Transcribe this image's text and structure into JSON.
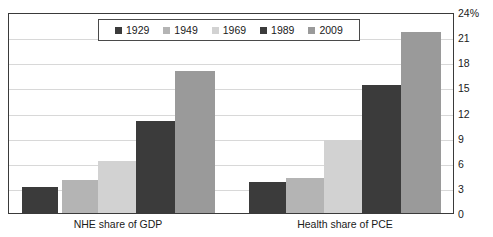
{
  "chart_data": {
    "type": "bar",
    "title": "",
    "subtitle": "",
    "xlabel": "",
    "ylabel": "",
    "categories": [
      "NHE share of GDP",
      "Health share of PCE"
    ],
    "series": [
      {
        "name": "1929",
        "color": "#3b3b3b",
        "values": [
          3.1,
          3.7
        ]
      },
      {
        "name": "1949",
        "color": "#b4b4b4",
        "values": [
          4.0,
          4.3
        ]
      },
      {
        "name": "1969",
        "color": "#d2d2d2",
        "values": [
          6.3,
          8.9
        ]
      },
      {
        "name": "1989",
        "color": "#3b3b3b",
        "values": [
          11.2,
          15.5
        ]
      },
      {
        "name": "2009",
        "color": "#9a9a9a",
        "values": [
          17.2,
          21.9
        ]
      }
    ],
    "ylim": [
      0,
      24
    ],
    "y_ticks": [
      "0",
      "3",
      "6",
      "9",
      "12",
      "15",
      "18",
      "21",
      "24%"
    ],
    "y_tick_values": [
      0,
      3,
      6,
      9,
      12,
      15,
      18,
      21,
      24
    ],
    "grid": true,
    "grid_axis": "y",
    "legend_position": "top-center",
    "legend_entries": [
      "1929",
      "1949",
      "1969",
      "1989",
      "2009"
    ]
  },
  "axis": {
    "y_unit_label": "24%",
    "ticks": [
      "24%",
      "21",
      "18",
      "15",
      "12",
      "9",
      "6",
      "3",
      "0"
    ]
  },
  "legend": {
    "items": [
      {
        "label": "1929",
        "swatch": "legend-swatch-1929"
      },
      {
        "label": "1949",
        "swatch": "legend-swatch-1949"
      },
      {
        "label": "1969",
        "swatch": "legend-swatch-1969"
      },
      {
        "label": "1989",
        "swatch": "legend-swatch-1989"
      },
      {
        "label": "2009",
        "swatch": "legend-swatch-2009"
      }
    ]
  },
  "categories": {
    "first": "NHE share of GDP",
    "second": "Health share of PCE"
  },
  "colors": {
    "dark": "#3b3b3b",
    "mid_light": "#b4b4b4",
    "light": "#d2d2d2",
    "mid": "#9a9a9a",
    "frame": "#3a3a3a",
    "grid": "#d8d8d8",
    "background": "#ffffff"
  }
}
